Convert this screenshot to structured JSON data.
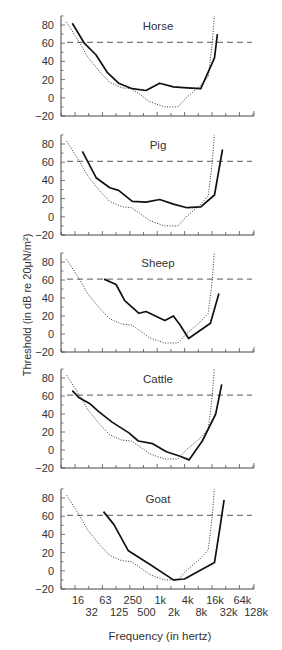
{
  "chart_data": {
    "type": "line",
    "title": "",
    "xlabel": "Frequency (in hertz)",
    "ylabel": "Threshold (in dB re 20μN/m²)",
    "x_scale": "log2",
    "x_tick_labels_upper": [
      "16",
      "63",
      "250",
      "1k",
      "4k",
      "16k",
      "64k"
    ],
    "x_tick_labels_lower": [
      "32",
      "125",
      "500",
      "2k",
      "8k",
      "32k",
      "128k"
    ],
    "x_ticks_hz": [
      16,
      32,
      63,
      125,
      250,
      500,
      1000,
      2000,
      4000,
      8000,
      16000,
      32000,
      64000,
      128000
    ],
    "y_ticks": [
      80,
      60,
      40,
      20,
      0,
      -20
    ],
    "ylim": [
      -20,
      90
    ],
    "grid": false,
    "legend": "none",
    "reference_line": {
      "style": "dashed",
      "value_db": 61
    },
    "human_reference_curve": {
      "style": "dotted",
      "points_hz_db": [
        [
          9,
          83
        ],
        [
          17.7,
          60
        ],
        [
          26,
          45
        ],
        [
          49,
          28
        ],
        [
          79,
          17
        ],
        [
          147,
          11
        ],
        [
          239,
          10
        ],
        [
          362,
          4
        ],
        [
          588,
          -4
        ],
        [
          1260,
          -10
        ],
        [
          2520,
          -10
        ],
        [
          3820,
          0
        ],
        [
          7640,
          13
        ],
        [
          11590,
          23
        ],
        [
          14260,
          60
        ],
        [
          15820,
          90
        ]
      ]
    },
    "panels": [
      {
        "name": "Horse",
        "points_hz_db": [
          [
            12,
            82
          ],
          [
            22,
            60
          ],
          [
            40,
            47
          ],
          [
            70,
            28
          ],
          [
            125,
            16
          ],
          [
            250,
            10
          ],
          [
            500,
            8
          ],
          [
            1000,
            16
          ],
          [
            2000,
            12
          ],
          [
            4000,
            11
          ],
          [
            8000,
            10
          ],
          [
            16000,
            44
          ],
          [
            18500,
            70
          ]
        ]
      },
      {
        "name": "Pig",
        "points_hz_db": [
          [
            20,
            72
          ],
          [
            40,
            43
          ],
          [
            80,
            32
          ],
          [
            125,
            29
          ],
          [
            250,
            17
          ],
          [
            500,
            16
          ],
          [
            1000,
            19
          ],
          [
            2000,
            14
          ],
          [
            4000,
            10
          ],
          [
            8000,
            11
          ],
          [
            16000,
            24
          ],
          [
            24000,
            74
          ]
        ]
      },
      {
        "name": "Sheep",
        "points_hz_db": [
          [
            60,
            61
          ],
          [
            110,
            55
          ],
          [
            170,
            37
          ],
          [
            350,
            23
          ],
          [
            500,
            25
          ],
          [
            1300,
            15
          ],
          [
            2000,
            20
          ],
          [
            2800,
            10
          ],
          [
            4300,
            -5
          ],
          [
            13000,
            12
          ],
          [
            20000,
            45
          ]
        ]
      },
      {
        "name": "Cattle",
        "points_hz_db": [
          [
            12,
            66
          ],
          [
            17,
            58
          ],
          [
            30,
            51
          ],
          [
            45,
            43
          ],
          [
            90,
            31
          ],
          [
            210,
            19
          ],
          [
            340,
            10
          ],
          [
            700,
            7
          ],
          [
            1400,
            -2
          ],
          [
            2800,
            -7
          ],
          [
            4400,
            -11
          ],
          [
            8600,
            10
          ],
          [
            17000,
            40
          ],
          [
            23000,
            73
          ]
        ]
      },
      {
        "name": "Goat",
        "points_hz_db": [
          [
            58,
            65
          ],
          [
            98,
            51
          ],
          [
            205,
            22
          ],
          [
            650,
            6
          ],
          [
            2000,
            -10
          ],
          [
            3500,
            -9
          ],
          [
            8000,
            1
          ],
          [
            16000,
            9
          ],
          [
            21000,
            47
          ],
          [
            26000,
            78
          ]
        ]
      }
    ]
  }
}
